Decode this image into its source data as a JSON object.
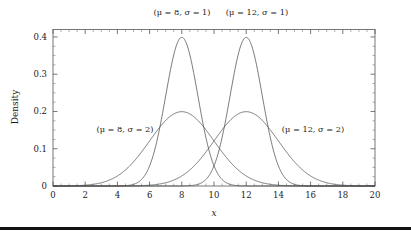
{
  "figure": {
    "background_color": "#ffffff",
    "curve_color": "#4d4d4d",
    "frame_color": "#555555",
    "text_color": "#1a1a1a",
    "rule_color": "#111111"
  },
  "chart_data": {
    "type": "line",
    "title": "",
    "xlabel": "x",
    "ylabel": "Density",
    "xlim": [
      0,
      20
    ],
    "ylim": [
      0,
      0.42
    ],
    "grid": false,
    "legend_position": "inline-annotations",
    "x_ticks": [
      0,
      2,
      4,
      6,
      8,
      10,
      12,
      14,
      16,
      18,
      20
    ],
    "x_tick_labels": [
      "0",
      "2",
      "4",
      "6",
      "8",
      "10",
      "12",
      "14",
      "16",
      "18",
      "20"
    ],
    "x_minor_tick_step": 0.5,
    "y_ticks": [
      0,
      0.1,
      0.2,
      0.3,
      0.4
    ],
    "y_tick_labels": [
      "0",
      "0.1",
      "0.2",
      "0.3",
      "0.4"
    ],
    "y_minor_tick_step": 0.025,
    "series": [
      {
        "name": "(μ = 8, σ = 1)",
        "distribution": "normal",
        "mu": 8,
        "sigma": 1,
        "peak_density": 0.3989,
        "peak_x": 8,
        "label_position": "above-plot-left"
      },
      {
        "name": "(μ = 12, σ = 1)",
        "distribution": "normal",
        "mu": 12,
        "sigma": 1,
        "peak_density": 0.3989,
        "peak_x": 12,
        "label_position": "above-plot-right"
      },
      {
        "name": "(μ = 8, σ = 2)",
        "distribution": "normal",
        "mu": 8,
        "sigma": 2,
        "peak_density": 0.1995,
        "peak_x": 8,
        "label_position": "inside-left"
      },
      {
        "name": "(μ = 12, σ = 2)",
        "distribution": "normal",
        "mu": 12,
        "sigma": 2,
        "peak_density": 0.1995,
        "peak_x": 12,
        "label_position": "inside-right"
      }
    ],
    "annotations": [
      {
        "text": "(μ = 8, σ = 1)",
        "x": 8,
        "y": 0.44,
        "anchor": "middle"
      },
      {
        "text": "(μ = 12, σ = 1)",
        "x": 12.6,
        "y": 0.44,
        "anchor": "middle"
      },
      {
        "text": "(μ = 8, σ = 2)",
        "x": 4.5,
        "y": 0.145,
        "anchor": "middle"
      },
      {
        "text": "(μ = 12, σ = 2)",
        "x": 16.1,
        "y": 0.145,
        "anchor": "middle"
      }
    ]
  },
  "labels": {
    "top_left_annotation": "(μ = 8, σ = 1)",
    "top_right_annotation": "(μ = 12, σ = 1)",
    "inner_left_annotation": "(μ = 8, σ = 2)",
    "inner_right_annotation": "(μ = 12, σ = 2)",
    "y_axis_title": "Density",
    "x_axis_title": "x",
    "y_tick_0": "0",
    "y_tick_1": "0.1",
    "y_tick_2": "0.2",
    "y_tick_3": "0.3",
    "y_tick_4": "0.4",
    "x_tick_0": "0",
    "x_tick_2": "2",
    "x_tick_4": "4",
    "x_tick_6": "6",
    "x_tick_8": "8",
    "x_tick_10": "10",
    "x_tick_12": "12",
    "x_tick_14": "14",
    "x_tick_16": "16",
    "x_tick_18": "18",
    "x_tick_20": "20"
  }
}
